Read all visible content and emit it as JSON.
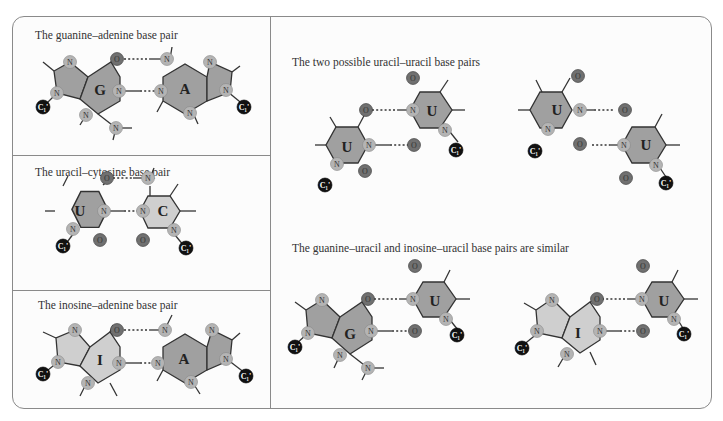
{
  "figure": {
    "panels": [
      {
        "id": "ga",
        "title": "The guanine–adenine base pair",
        "bases": [
          "G",
          "A"
        ]
      },
      {
        "id": "uc",
        "title": "The uracil–cytosine base pair",
        "bases": [
          "U",
          "C"
        ]
      },
      {
        "id": "ia",
        "title": "The inosine–adenine base pair",
        "bases": [
          "I",
          "A"
        ]
      },
      {
        "id": "uu",
        "title": "The two possible uracil–uracil base pairs",
        "bases": [
          "U",
          "U",
          "U",
          "U"
        ]
      },
      {
        "id": "gu",
        "title": "The guanine–uracil and inosine–uracil base pairs are similar",
        "bases": [
          "G",
          "U",
          "I",
          "U"
        ]
      }
    ],
    "atom_labels": {
      "nitrogen": "N",
      "oxygen": "O",
      "sugar_carbon": "C1'"
    },
    "colors": {
      "purine_dark": "#a0a0a0",
      "pyrimidine_light": "#cfcfcf",
      "nitrogen": "#b4b4b4",
      "oxygen": "#707070",
      "c1_carbon": "#111111",
      "border": "#8a8a8a"
    }
  }
}
